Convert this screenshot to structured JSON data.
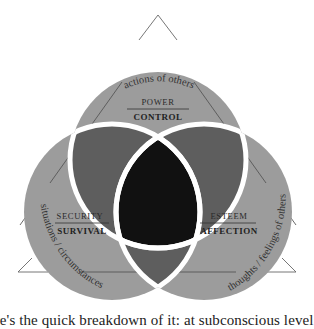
{
  "diagram": {
    "type": "three-circle-venn",
    "colors": {
      "circle_fill": "#9c9c9c",
      "pair_overlap_fill": "#5e5e5e",
      "center_fill": "#111111",
      "outline": "#ffffff",
      "triangle_stroke": "#555555",
      "text": "#222222"
    },
    "circles": [
      {
        "id": "top",
        "upper_label": "POWER",
        "lower_label": "CONTROL",
        "external_label": "actions of others"
      },
      {
        "id": "left",
        "upper_label": "SECURITY",
        "lower_label": "SURVIVAL",
        "external_label": "situations / circumstances"
      },
      {
        "id": "right",
        "upper_label": "ESTEEM",
        "lower_label": "AFFECTION",
        "external_label": "thoughts / feelings of others"
      }
    ]
  },
  "caption": {
    "text": "ere's the quick breakdown of it: at subconscious level"
  }
}
